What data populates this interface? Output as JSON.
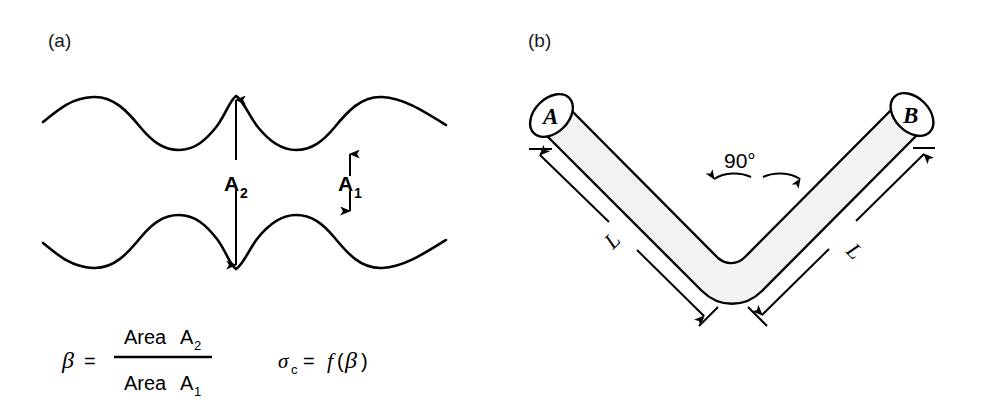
{
  "figure": {
    "panels": [
      {
        "id": "a",
        "label": "(a)"
      },
      {
        "id": "b",
        "label": "(b)"
      }
    ]
  },
  "panel_a": {
    "label": "(a)",
    "dimensions": [
      {
        "name": "A2",
        "base": "A",
        "subscript": "2",
        "description": "distance between upper curve crest and lower curve trough"
      },
      {
        "name": "A1",
        "base": "A",
        "subscript": "1",
        "description": "distance between upper curve trough and lower curve crest"
      }
    ],
    "formula": {
      "beta_symbol": "β",
      "equals": "=",
      "numerator_word": "Area",
      "numerator_base": "A",
      "numerator_sub": "2",
      "denominator_word": "Area",
      "denominator_base": "A",
      "denominator_sub": "1",
      "sigma_symbol": "σ",
      "sigma_sub": "c",
      "sigma_equals": "=",
      "function_symbol": "f",
      "function_open": "(",
      "function_arg": "β",
      "function_close": ")"
    }
  },
  "panel_b": {
    "label": "(b)",
    "end_caps": [
      {
        "name": "end-cap-a",
        "label": "A"
      },
      {
        "name": "end-cap-b",
        "label": "B"
      }
    ],
    "angle": {
      "value": "90°"
    },
    "lengths": [
      {
        "name": "length-left",
        "label": "L"
      },
      {
        "name": "length-right",
        "label": "L"
      }
    ]
  },
  "colors": {
    "stroke": "#000000",
    "bar_fill": "#f2f2f2",
    "background": "#ffffff",
    "label_gray": "#1a1a1a"
  }
}
